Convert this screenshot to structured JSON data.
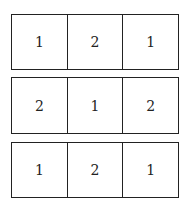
{
  "grid": {
    "rows": [
      {
        "cells": [
          "1",
          "2",
          "1"
        ]
      },
      {
        "cells": [
          "2",
          "1",
          "2"
        ]
      },
      {
        "cells": [
          "1",
          "2",
          "1"
        ]
      }
    ]
  }
}
